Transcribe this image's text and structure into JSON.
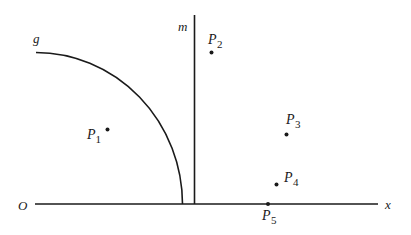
{
  "diagram": {
    "labels": {
      "origin": "O",
      "x_axis": "x",
      "curve": "g",
      "line": "m"
    },
    "points": [
      {
        "name": "P",
        "sub": "1"
      },
      {
        "name": "P",
        "sub": "2"
      },
      {
        "name": "P",
        "sub": "3"
      },
      {
        "name": "P",
        "sub": "4"
      },
      {
        "name": "P",
        "sub": "5"
      }
    ],
    "colors": {
      "ink": "#1a1a1a",
      "background": "#ffffff"
    }
  }
}
